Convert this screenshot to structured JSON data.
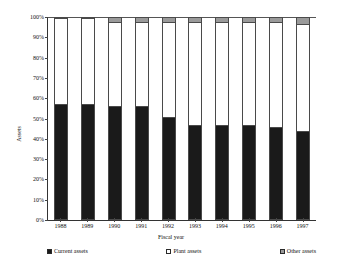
{
  "chart_data": {
    "type": "bar",
    "subtype": "100-percent-stacked-column",
    "title": "",
    "xlabel": "Fiscal year",
    "ylabel": "Assets",
    "categories": [
      "1988",
      "1989",
      "1990",
      "1991",
      "1992",
      "1993",
      "1994",
      "1995",
      "1996",
      "1997"
    ],
    "ylim": [
      0,
      100
    ],
    "ytick_labels": [
      "0%",
      "10%",
      "20%",
      "30%",
      "40%",
      "50%",
      "60%",
      "70%",
      "80%",
      "90%",
      "100%"
    ],
    "ytick_values": [
      0,
      10,
      20,
      30,
      40,
      50,
      60,
      70,
      80,
      90,
      100
    ],
    "grid": false,
    "legend_position": "bottom",
    "series": [
      {
        "name": "Current assets",
        "color": "#1a1a1a",
        "swatch": "sw-current",
        "values": [
          57,
          57,
          56,
          56,
          51,
          47,
          47,
          47,
          46,
          44
        ]
      },
      {
        "name": "Plant assets",
        "color": "#ffffff",
        "swatch": "sw-plant",
        "values": [
          43,
          43,
          42,
          42,
          47,
          51,
          51,
          51,
          52,
          53
        ]
      },
      {
        "name": "Other assets",
        "color": "#9a9a9a",
        "swatch": "sw-other",
        "values": [
          0,
          0,
          2,
          2,
          2,
          2,
          2,
          2,
          2,
          3
        ]
      }
    ]
  }
}
